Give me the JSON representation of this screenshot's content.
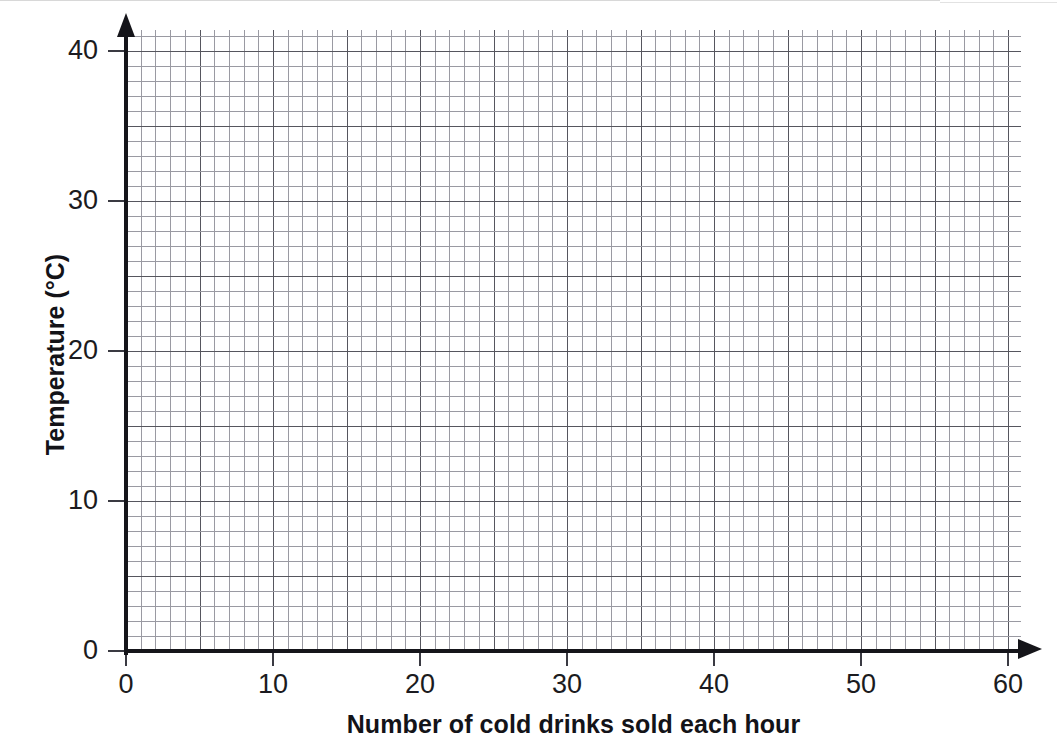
{
  "chart_data": {
    "type": "scatter",
    "title": "",
    "subtitle": "",
    "xlabel": "Number of cold drinks sold each hour",
    "ylabel": "Temperature (°C)",
    "xlim": [
      0,
      61
    ],
    "ylim": [
      0,
      41.4
    ],
    "x_ticks": [
      0,
      10,
      20,
      30,
      40,
      50,
      60
    ],
    "x_tick_labels": [
      "0",
      "10",
      "20",
      "30",
      "40",
      "50",
      "60"
    ],
    "y_ticks": [
      0,
      10,
      20,
      30,
      40
    ],
    "y_tick_labels": [
      "0",
      "10",
      "20",
      "30",
      "40"
    ],
    "x_minor_step": 1,
    "y_minor_step": 1,
    "x_major_step": 5,
    "y_major_step": 5,
    "grid": true,
    "grid_style": "graph-paper minor 1 unit, major every 5 units",
    "legend": null,
    "legend_position": "none",
    "series": [],
    "values": [],
    "annotations": []
  },
  "axes": {
    "y_title": "Temperature (°C)",
    "x_title": "Number of cold drinks sold each hour",
    "x_tick_labels": [
      "0",
      "10",
      "20",
      "30",
      "40",
      "50",
      "60"
    ],
    "y_tick_labels": [
      "0",
      "10",
      "20",
      "30",
      "40"
    ],
    "arrow_x_icon": "arrow-right-icon",
    "arrow_y_icon": "arrow-up-icon"
  },
  "colors": {
    "axis": "#15151a",
    "grid_minor": "#9a9aa2",
    "grid_major": "#56565e",
    "text": "#131318",
    "background": "#ffffff"
  }
}
